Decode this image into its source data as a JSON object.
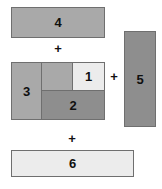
{
  "diagram": {
    "background": "#ffffff",
    "border_color": "#6f6f6f",
    "colors": {
      "medium_gray": "#a9a9a9",
      "dark_gray": "#8e8e8e",
      "light_gray": "#ececec"
    },
    "pieces": [
      {
        "id": "rect-4",
        "label": "4",
        "fill": "#a9a9a9",
        "shape": "horizontal-bar"
      },
      {
        "id": "rect-3",
        "label": "3",
        "fill": "#a9a9a9",
        "shape": "vertical-bar"
      },
      {
        "id": "rect-sub",
        "label": "",
        "fill": "#a9a9a9",
        "shape": "square"
      },
      {
        "id": "rect-1",
        "label": "1",
        "fill": "#ececec",
        "shape": "square"
      },
      {
        "id": "rect-2",
        "label": "2",
        "fill": "#8e8e8e",
        "shape": "horizontal-bar"
      },
      {
        "id": "rect-5",
        "label": "5",
        "fill": "#8e8e8e",
        "shape": "vertical-bar"
      },
      {
        "id": "rect-6",
        "label": "6",
        "fill": "#ececec",
        "shape": "horizontal-bar"
      }
    ],
    "operators": [
      {
        "id": "plus-1",
        "symbol": "+"
      },
      {
        "id": "plus-2",
        "symbol": "+"
      },
      {
        "id": "plus-3",
        "symbol": "+"
      }
    ]
  }
}
